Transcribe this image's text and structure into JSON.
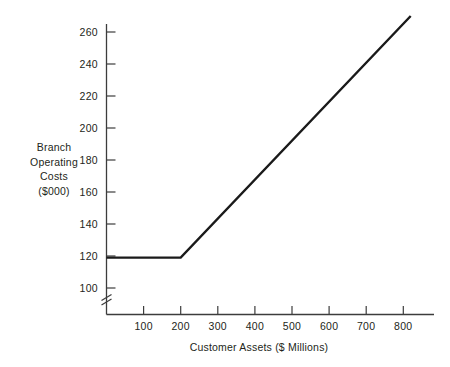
{
  "chart_data": {
    "type": "line",
    "title": "",
    "subtitle": "",
    "xlabel": "Customer Assets ($ Millions)",
    "ylabel": "Branch Operating Costs ($000)",
    "ylabel_lines": [
      "Branch",
      "Operating",
      "Costs",
      "($000)"
    ],
    "xlim": [
      0,
      880
    ],
    "ylim": [
      88,
      278
    ],
    "y_axis_break": true,
    "y_axis_break_note": "zig-zag break mark on y-axis below the 100 tick",
    "grid": false,
    "legend": null,
    "xticks": [
      100,
      200,
      300,
      400,
      500,
      600,
      700,
      800
    ],
    "xtick_labels": [
      "100",
      "200",
      "300",
      "400",
      "500",
      "600",
      "700",
      "800"
    ],
    "yticks": [
      100,
      120,
      140,
      160,
      180,
      200,
      220,
      240,
      260
    ],
    "ytick_labels": [
      "100",
      "120",
      "140",
      "160",
      "180",
      "200",
      "220",
      "240",
      "260"
    ],
    "series": [
      {
        "name": "Branch operating costs",
        "x": [
          0,
          200,
          820
        ],
        "y": [
          119,
          119,
          270
        ],
        "color": "#1a1a1a",
        "linewidth": 2.4,
        "description": "Flat at 119 up to 200 of customer assets, then rises linearly to 270 at 820"
      }
    ],
    "annotations": [],
    "colors": {
      "axis": "#3c3c3c",
      "line": "#1a1a1a",
      "text": "#231f20",
      "background": "#ffffff"
    }
  }
}
